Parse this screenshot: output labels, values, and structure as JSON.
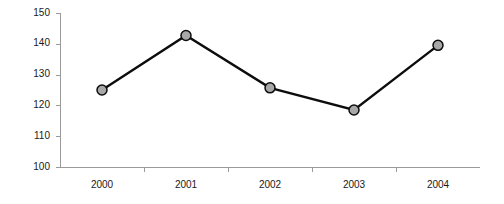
{
  "chart_data": {
    "type": "line",
    "title": "",
    "subtitle": "",
    "xlabel": "",
    "ylabel": "",
    "categories": [
      "2000",
      "2001",
      "2002",
      "2003",
      "2004"
    ],
    "series": [
      {
        "name": "series-1",
        "values": [
          125,
          142.7,
          125.7,
          118.5,
          139.5
        ]
      }
    ],
    "ylim": [
      100,
      150
    ],
    "ytick_values": [
      100,
      110,
      120,
      130,
      140,
      150
    ],
    "ytick_labels": [
      "100",
      "110",
      "120",
      "130",
      "140",
      "150"
    ],
    "xtick_labels": [
      "2000",
      "2001",
      "2002",
      "2003",
      "2004"
    ],
    "grid": false,
    "legend": null,
    "legend_position": "none",
    "annotations": [],
    "marker": "circle",
    "marker_fill_color": "#a8a8a8",
    "marker_edge_color": "#0d0d0d",
    "line_color": "#0d0d0d",
    "axis_color": "#9a9a9a",
    "background_color": "#ffffff",
    "text_color": "#1a1a1a"
  },
  "geometry": {
    "width": 504,
    "height": 204,
    "plot_left": 60,
    "plot_right": 480,
    "plot_top": 13,
    "plot_bottom": 167
  }
}
